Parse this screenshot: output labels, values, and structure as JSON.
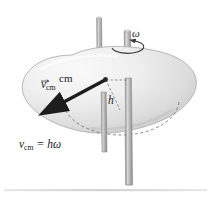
{
  "figure": {
    "background_color": "#ffffff",
    "baseline_color": "#d8d8d8"
  },
  "labels": {
    "cm": "cm",
    "velocity_symbol": "v",
    "velocity_subscript": "cm",
    "height_symbol": "h",
    "omega": "ω",
    "equation_v": "v",
    "equation_sub": "cm",
    "equation_rest": " = hω"
  },
  "body": {
    "name": "irregular-rigid-body-blob",
    "fill_light": "#f4f4f4",
    "fill_mid": "#e2e2e2",
    "fill_shadow": "#cfcfcf",
    "outline_color": "#b6b6b6"
  },
  "rods": [
    {
      "name": "front-rod",
      "top_x": 99,
      "bottom_x": 104,
      "top_y": 18,
      "bottom_y": 152,
      "width": 5,
      "color_light": "#c9c9c9",
      "color_dark": "#8e8e8e"
    },
    {
      "name": "rotation-axis-rod",
      "top_x": 126,
      "bottom_x": 128,
      "top_y": 31,
      "bottom_y": 185,
      "width": 6,
      "color_light": "#cdcdcd",
      "color_dark": "#909090"
    }
  ],
  "circular_path": {
    "name": "dashed-circular-trajectory",
    "center_x": 121,
    "center_y": 100,
    "radius_x": 58,
    "radius_y": 35,
    "stroke": "#7a7a7a",
    "dash": "3,2.5"
  },
  "velocity_vector": {
    "name": "velocity-arrow",
    "from_x": 105,
    "from_y": 80,
    "to_x": 58,
    "to_y": 105,
    "color": "#1d1d1d"
  },
  "radius_line": {
    "name": "radius-h-dashed-line",
    "from_x": 105,
    "from_y": 80,
    "to_x": 117,
    "to_y": 109,
    "stroke": "#6e6e6e"
  },
  "omega_arrow": {
    "name": "angular-velocity-curved-arrow",
    "color": "#3a3a3a"
  }
}
